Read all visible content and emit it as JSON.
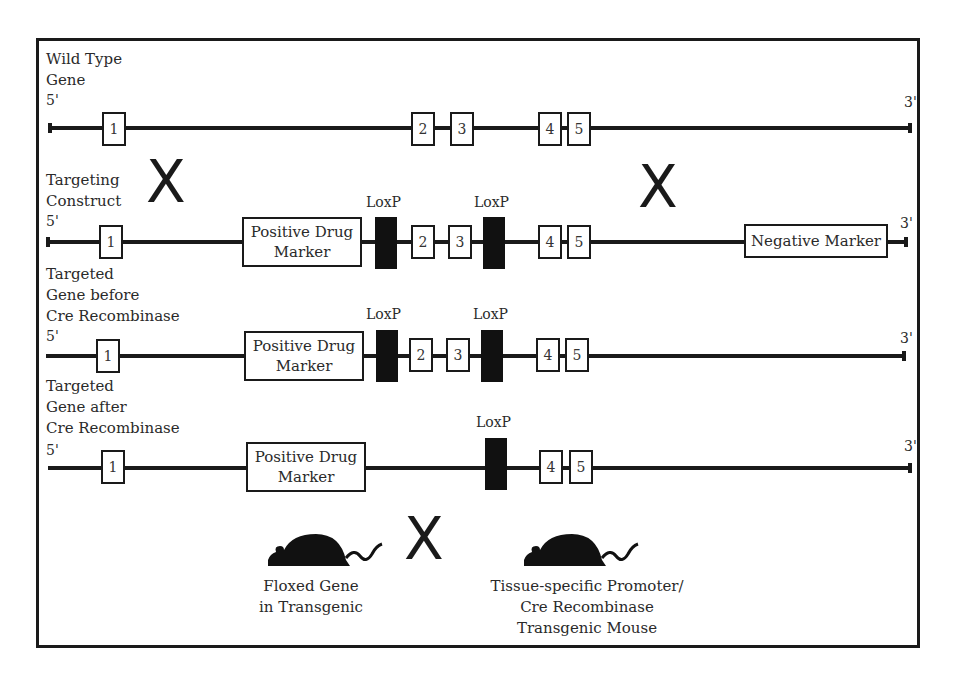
{
  "rows": [
    {
      "label_lines": [
        "Wild Type",
        "Gene"
      ],
      "five_prime": "5'",
      "three_prime": "3'",
      "exons": [
        "1",
        "2",
        "3",
        "4",
        "5"
      ]
    },
    {
      "label_lines": [
        "Targeting",
        "Construct"
      ],
      "five_prime": "5'",
      "three_prime": "3'",
      "exons": [
        "1",
        "2",
        "3",
        "4",
        "5"
      ],
      "positive_marker": "Positive Drug Marker",
      "negative_marker": "Negative Marker",
      "loxp": [
        "LoxP",
        "LoxP"
      ]
    },
    {
      "label_lines": [
        "Targeted",
        "Gene before",
        "Cre Recombinase"
      ],
      "five_prime": "5'",
      "three_prime": "3'",
      "exons": [
        "1",
        "2",
        "3",
        "4",
        "5"
      ],
      "positive_marker": "Positive Drug Marker",
      "loxp": [
        "LoxP",
        "LoxP"
      ]
    },
    {
      "label_lines": [
        "Targeted",
        "Gene after",
        "Cre Recombinase"
      ],
      "five_prime": "5'",
      "three_prime": "3'",
      "exons": [
        "1",
        "4",
        "5"
      ],
      "positive_marker": "Positive Drug Marker",
      "loxp": [
        "LoxP"
      ]
    }
  ],
  "crossover_symbol": "X",
  "mice": [
    {
      "caption_lines": [
        "Floxed Gene",
        "in Transgenic"
      ]
    },
    {
      "caption_lines": [
        "Tissue-specific Promoter/",
        "Cre Recombinase",
        "Transgenic Mouse"
      ]
    }
  ],
  "colors": {
    "line": "#1a1a1a",
    "loxp": "#111111",
    "background": "#ffffff"
  }
}
